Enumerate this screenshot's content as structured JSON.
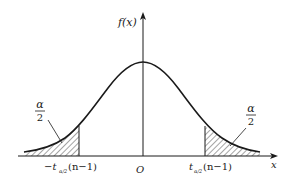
{
  "figure": {
    "type": "t-distribution density with two-tailed rejection regions",
    "y_axis_label": "f(x)",
    "x_axis_label": "x",
    "origin_label": "O",
    "left_tail_area_label": {
      "numerator": "α",
      "denominator": "2"
    },
    "right_tail_area_label": {
      "numerator": "α",
      "denominator": "2"
    },
    "left_critical_value": {
      "prefix": "−t",
      "subscript": "α/2",
      "suffix": "(n−1)"
    },
    "right_critical_value": {
      "prefix": "t",
      "subscript": "α/2",
      "suffix": "(n−1)"
    },
    "colors": {
      "stroke": "#1a1a1a",
      "background": "#ffffff"
    }
  }
}
